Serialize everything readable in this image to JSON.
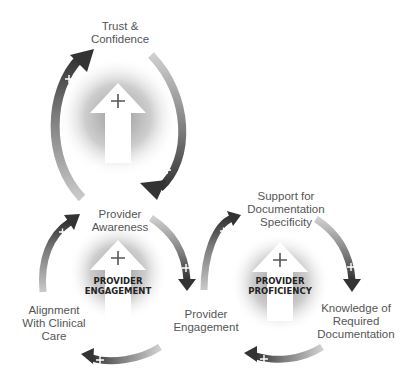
{
  "diagram": {
    "type": "reinforcing-loops",
    "colors": {
      "arrow_dark": "#3a3a3a",
      "arrow_mid": "#8a8a8a",
      "glow": "#9a9a9a",
      "text": "#555555",
      "core_text": "#222222"
    },
    "loops": [
      {
        "id": "top",
        "core_label": "",
        "core_symbol": "+",
        "nodes": [
          {
            "label": "Trust &\nConfidence"
          },
          {
            "label": "Provider\nAwareness"
          }
        ],
        "links": [
          {
            "from": "Provider Awareness",
            "to": "Trust & Confidence",
            "polarity": "+"
          },
          {
            "from": "Trust & Confidence",
            "to": "Provider Awareness",
            "polarity": "+"
          }
        ]
      },
      {
        "id": "engagement",
        "core_label": "PROVIDER\nENGAGEMENT",
        "core_symbol": "+",
        "nodes": [
          {
            "label": "Provider\nAwareness"
          },
          {
            "label": "Provider\nEngagement"
          },
          {
            "label": "Alignment\nWith Clinical\nCare"
          }
        ],
        "links": [
          {
            "from": "Provider Awareness",
            "to": "Provider Engagement",
            "polarity": "+"
          },
          {
            "from": "Provider Engagement",
            "to": "Alignment With Clinical Care",
            "polarity": "+"
          },
          {
            "from": "Alignment With Clinical Care",
            "to": "Provider Awareness",
            "polarity": "+"
          }
        ]
      },
      {
        "id": "proficiency",
        "core_label": "PROVIDER\nPROFICIENCY",
        "core_symbol": "+",
        "nodes": [
          {
            "label": "Support for\nDocumentation\nSpecificity"
          },
          {
            "label": "Knowledge of\nRequired\nDocumentation"
          },
          {
            "label": "Provider\nEngagement"
          }
        ],
        "links": [
          {
            "from": "Support for Documentation Specificity",
            "to": "Knowledge of Required Documentation",
            "polarity": "+"
          },
          {
            "from": "Knowledge of Required Documentation",
            "to": "Provider Engagement",
            "polarity": "+"
          },
          {
            "from": "Provider Engagement",
            "to": "Support for Documentation Specificity",
            "polarity": "+"
          }
        ]
      }
    ],
    "plus_sign": "+"
  }
}
